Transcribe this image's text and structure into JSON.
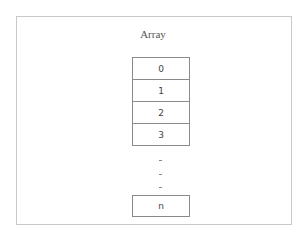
{
  "diagram": {
    "title": "Array",
    "cells": [
      "0",
      "1",
      "2",
      "3"
    ],
    "ellipsis": [
      ".",
      ".",
      "."
    ],
    "last_cell": "n",
    "colors": {
      "frame_border": "#c8c8c8",
      "cell_border": "#8a8a8a",
      "text": "#444444"
    }
  }
}
